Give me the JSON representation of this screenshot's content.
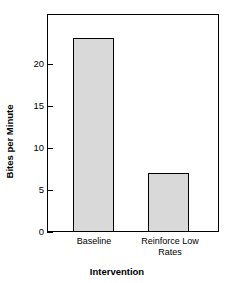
{
  "chart_data": {
    "type": "bar",
    "title": "",
    "xlabel": "Intervention",
    "ylabel": "Bites per Minute",
    "categories": [
      "Baseline",
      "Reinforce Low Rates"
    ],
    "values": [
      23,
      7
    ],
    "ylim": [
      0,
      25.8
    ],
    "yticks": [
      0,
      5,
      10,
      15,
      20
    ],
    "ytick_labels": [
      "0",
      "5",
      "10",
      "15",
      "20"
    ],
    "grid": false,
    "legend": null,
    "colors": {
      "bar_fill": "#d9d9d9",
      "bar_edge": "#000000",
      "axis": "#000000",
      "background": "#ffffff",
      "text": "#000000"
    }
  },
  "axis": {
    "y_title": "Bites per Minute",
    "x_title": "Intervention"
  },
  "category_labels": [
    {
      "line1": "Baseline",
      "line2": ""
    },
    {
      "line1": "Reinforce Low",
      "line2": "Rates"
    }
  ]
}
